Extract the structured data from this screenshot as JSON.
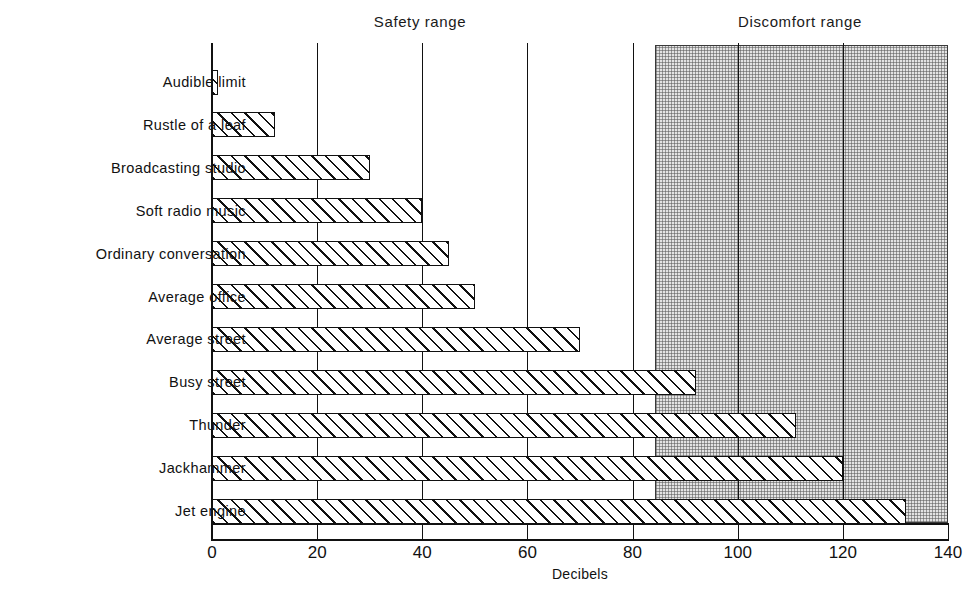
{
  "chart_data": {
    "type": "bar",
    "orientation": "horizontal",
    "title": "",
    "xlabel": "Decibels",
    "ylabel": "",
    "xlim": [
      0,
      140
    ],
    "xticks": [
      0,
      20,
      40,
      60,
      80,
      100,
      120,
      140
    ],
    "xtick_labels": [
      "0",
      "20",
      "40",
      "60",
      "80",
      "100",
      "120",
      "140"
    ],
    "grid": "vertical gridlines at every x tick",
    "legend": "none",
    "categories": [
      "Audible limit",
      "Rustle of a leaf",
      "Broadcasting studio",
      "Soft radio music",
      "Ordinary conversation",
      "Average office",
      "Average street",
      "Busy street",
      "Thunder",
      "Jackhammer",
      "Jet engine"
    ],
    "values": [
      1,
      12,
      30,
      40,
      45,
      50,
      70,
      92,
      111,
      120,
      132
    ],
    "annotations": [
      {
        "name": "safety-range",
        "label": "Safety range",
        "x_center": 40
      },
      {
        "name": "discomfort-range",
        "label": "Discomfort range",
        "x_center": 112,
        "band_start": 84,
        "band_end": 140
      }
    ],
    "bar_style": "diagonal hatch fill, black outline",
    "band_style": "stippled grey shading"
  },
  "captions": {
    "safety_range": "Safety range",
    "discomfort_range": "Discomfort range"
  },
  "axis": {
    "x_title": "Decibels"
  }
}
